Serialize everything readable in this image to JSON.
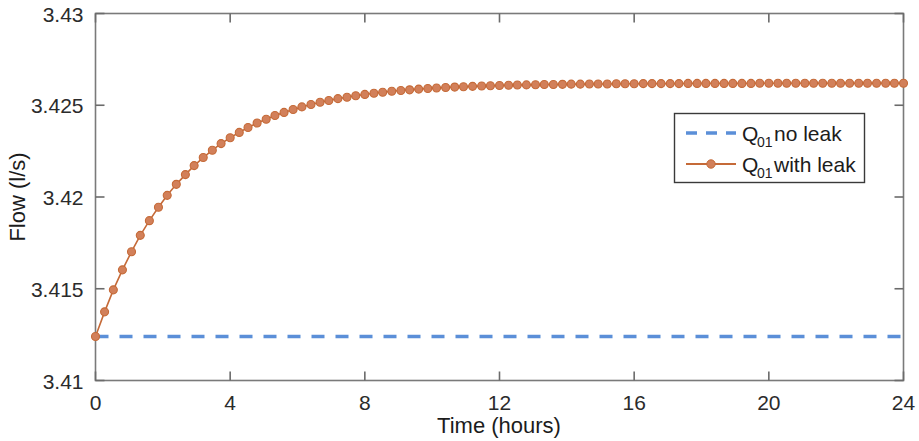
{
  "figure": {
    "width": 919,
    "height": 441,
    "background": "#ffffff"
  },
  "chart_data": {
    "type": "line",
    "title": "",
    "xlabel": "Time (hours)",
    "ylabel": "Flow (l/s)",
    "xlim": [
      0,
      24
    ],
    "ylim": [
      3.41,
      3.43
    ],
    "xticks": [
      0,
      4,
      8,
      12,
      16,
      20,
      24
    ],
    "xtick_labels": [
      "0",
      "4",
      "8",
      "12",
      "16",
      "20",
      "24"
    ],
    "yticks": [
      3.41,
      3.415,
      3.42,
      3.425,
      3.43
    ],
    "ytick_labels": [
      "3.41",
      "3.415",
      "3.42",
      "3.425",
      "3.43"
    ],
    "grid": false,
    "legend_position": "upper right",
    "series": [
      {
        "name": "Q01 no leak",
        "label_main": "Q",
        "label_sub": "01",
        "label_rest": " no leak",
        "color": "#5B8FD8",
        "linestyle": "dashed",
        "marker": "none",
        "constant_value": 3.4124,
        "x": [
          0,
          24
        ],
        "values": [
          3.4124,
          3.4124
        ]
      },
      {
        "name": "Q01 with leak",
        "label_main": "Q",
        "label_sub": "01",
        "label_rest": " with leak",
        "color": "#C56A38",
        "linestyle": "solid",
        "marker": "circle",
        "marker_face": "#D2805A",
        "model": "y = 3.4124 + 0.0138*(1 - exp(-t/2.6))",
        "asymptote": 3.4262,
        "start_value": 3.4124,
        "x": [
          0,
          0.27,
          0.53,
          0.8,
          1.07,
          1.33,
          1.6,
          1.87,
          2.13,
          2.4,
          2.67,
          2.93,
          3.2,
          3.47,
          3.73,
          4,
          4.27,
          4.53,
          4.8,
          5.07,
          5.33,
          5.6,
          5.87,
          6.13,
          6.4,
          6.67,
          6.93,
          7.2,
          7.47,
          7.73,
          8,
          8.27,
          8.53,
          8.8,
          9.07,
          9.33,
          9.6,
          9.87,
          10.13,
          10.4,
          10.67,
          10.93,
          11.2,
          11.47,
          11.73,
          12,
          12.27,
          12.53,
          12.8,
          13.07,
          13.33,
          13.6,
          13.87,
          14.13,
          14.4,
          14.67,
          14.93,
          15.2,
          15.47,
          15.73,
          16,
          16.27,
          16.53,
          16.8,
          17.07,
          17.33,
          17.6,
          17.87,
          18.13,
          18.4,
          18.67,
          18.93,
          19.2,
          19.47,
          19.73,
          20,
          20.27,
          20.53,
          20.8,
          21.07,
          21.33,
          21.6,
          21.87,
          22.13,
          22.4,
          22.67,
          22.93,
          23.2,
          23.47,
          23.73,
          24
        ],
        "values": [
          3.4124,
          3.41374,
          3.41494,
          3.41603,
          3.41702,
          3.41791,
          3.41871,
          3.41944,
          3.42009,
          3.42069,
          3.42122,
          3.42171,
          3.42215,
          3.42255,
          3.42291,
          3.42323,
          3.42352,
          3.42379,
          3.42403,
          3.42424,
          3.42444,
          3.42461,
          3.42477,
          3.42491,
          3.42504,
          3.42516,
          3.42526,
          3.42536,
          3.42544,
          3.42552,
          3.42559,
          3.42565,
          3.42571,
          3.42576,
          3.4258,
          3.42584,
          3.42588,
          3.42591,
          3.42594,
          3.42597,
          3.42599,
          3.42601,
          3.42603,
          3.42605,
          3.42606,
          3.42608,
          3.42609,
          3.4261,
          3.42611,
          3.42612,
          3.42613,
          3.42613,
          3.42614,
          3.42615,
          3.42615,
          3.42616,
          3.42616,
          3.42616,
          3.42617,
          3.42617,
          3.42617,
          3.42618,
          3.42618,
          3.42618,
          3.42618,
          3.42618,
          3.42619,
          3.42619,
          3.42619,
          3.42619,
          3.42619,
          3.42619,
          3.42619,
          3.42619,
          3.4262,
          3.4262,
          3.4262,
          3.4262,
          3.4262,
          3.4262,
          3.4262,
          3.4262,
          3.4262,
          3.4262,
          3.4262,
          3.4262,
          3.4262,
          3.4262,
          3.4262,
          3.4262,
          3.4262
        ]
      }
    ]
  },
  "legend": {
    "entries": [
      {
        "main": "Q",
        "sub": "01",
        "rest": " no leak",
        "color": "#5B8FD8",
        "style": "dashed"
      },
      {
        "main": "Q",
        "sub": "01",
        "rest": " with leak",
        "color": "#C56A38",
        "style": "solid-marker"
      }
    ]
  },
  "colors": {
    "no_leak": "#5B8FD8",
    "with_leak_line": "#C56A38",
    "with_leak_marker": "#D2805A",
    "axis": "#6b6b6b",
    "text": "#1c1c1c"
  }
}
